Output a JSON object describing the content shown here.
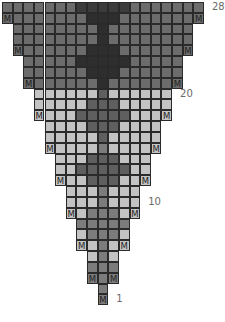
{
  "chart": {
    "cell_symbol_make": "M",
    "colors": {
      "b": "#6c6c6c",
      "d": "#2e2e2e",
      "e": "#3c3c3c",
      "l": "#c3c3c3",
      "m": "#7c7c7c",
      "n": "#5f5f5f"
    },
    "row_labels": [
      {
        "row": 28,
        "text": "28"
      },
      {
        "row": 20,
        "text": "20"
      },
      {
        "row": 10,
        "text": "10"
      },
      {
        "row": 1,
        "text": "1"
      }
    ],
    "rows": [
      {
        "row": 28,
        "start": 0,
        "cells": "bbbbbbbeeeeebbbbbbb",
        "m": false
      },
      {
        "row": 27,
        "start": 0,
        "cells": "bbbbbbbbdddbbbbbbbb",
        "m": true
      },
      {
        "row": 26,
        "start": 1,
        "cells": "bbbbbbbbdbbbbbbbb",
        "m": false
      },
      {
        "row": 25,
        "start": 1,
        "cells": "bbbbbbbbdbbbbbbbb",
        "m": false
      },
      {
        "row": 24,
        "start": 1,
        "cells": "bbbbbbbdddbbbbbbb",
        "m": true
      },
      {
        "row": 23,
        "start": 2,
        "cells": "bbbbbdddddbbbbb",
        "m": false
      },
      {
        "row": 22,
        "start": 2,
        "cells": "bbbbbbdddbbbbbb",
        "m": false
      },
      {
        "row": 21,
        "start": 2,
        "cells": "bbbbbbbdbbbbbbb",
        "m": true
      },
      {
        "row": 20,
        "start": 3,
        "cells": "llllllnllllll",
        "m": false
      },
      {
        "row": 19,
        "start": 3,
        "cells": "lllllnnnlllll",
        "m": false
      },
      {
        "row": 18,
        "start": 3,
        "cells": "llllnnnnnllll",
        "m": true
      },
      {
        "row": 17,
        "start": 4,
        "cells": "llllnnnllll",
        "m": false
      },
      {
        "row": 16,
        "start": 4,
        "cells": "lllllnlllll",
        "m": false
      },
      {
        "row": 15,
        "start": 4,
        "cells": "lllllmlllll",
        "m": true
      },
      {
        "row": 14,
        "start": 5,
        "cells": "lllnnnlll",
        "m": false
      },
      {
        "row": 13,
        "start": 5,
        "cells": "llnnnnnll",
        "m": false
      },
      {
        "row": 12,
        "start": 5,
        "cells": "lllnnnlll",
        "m": true
      },
      {
        "row": 11,
        "start": 6,
        "cells": "lllmlll",
        "m": false
      },
      {
        "row": 10,
        "start": 6,
        "cells": "lllmlll",
        "m": false
      },
      {
        "row": 9,
        "start": 6,
        "cells": "llmmmll",
        "m": true
      },
      {
        "row": 8,
        "start": 7,
        "cells": "mmmmm",
        "m": false
      },
      {
        "row": 7,
        "start": 7,
        "cells": "lmmml",
        "m": false
      },
      {
        "row": 6,
        "start": 7,
        "cells": "llmll",
        "m": true
      },
      {
        "row": 5,
        "start": 8,
        "cells": "lml",
        "m": false
      },
      {
        "row": 4,
        "start": 8,
        "cells": "mmm",
        "m": false
      },
      {
        "row": 3,
        "start": 8,
        "cells": "mmm",
        "m": true
      },
      {
        "row": 2,
        "start": 9,
        "cells": "m",
        "m": false
      },
      {
        "row": 1,
        "start": 9,
        "cells": "m",
        "m": true
      }
    ]
  }
}
